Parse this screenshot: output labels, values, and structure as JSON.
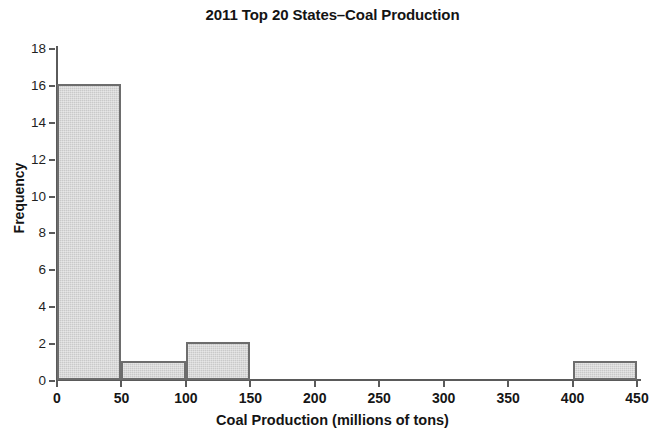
{
  "chart_data": {
    "type": "bar",
    "title": "2011 Top 20 States–Coal Production",
    "xlabel": "Coal Production (millions of tons)",
    "ylabel": "Frequency",
    "xlim": [
      0,
      450
    ],
    "ylim": [
      0,
      18
    ],
    "xticks": [
      0,
      50,
      100,
      150,
      200,
      250,
      300,
      350,
      400,
      450
    ],
    "yticks": [
      0,
      2,
      4,
      6,
      8,
      10,
      12,
      14,
      16,
      18
    ],
    "grid": false,
    "legend": null,
    "bin_width": 50,
    "bin_edges": [
      0,
      50,
      100,
      150,
      200,
      250,
      300,
      350,
      400,
      450
    ],
    "categories": [
      "0–50",
      "50–100",
      "100–150",
      "150–200",
      "200–250",
      "250–300",
      "300–350",
      "350–400",
      "400–450"
    ],
    "values": [
      16,
      1,
      2,
      0,
      0,
      0,
      0,
      0,
      1
    ],
    "bars": [
      {
        "x0": 0,
        "x1": 50,
        "value": 16
      },
      {
        "x0": 50,
        "x1": 100,
        "value": 1
      },
      {
        "x0": 100,
        "x1": 150,
        "value": 2
      },
      {
        "x0": 400,
        "x1": 450,
        "value": 1
      }
    ],
    "colors": {
      "bar_fill": "#c9c9c9",
      "bar_border": "#6d6d6d",
      "axis": "#5a5a5a",
      "text": "#141414",
      "background": "#ffffff"
    }
  }
}
